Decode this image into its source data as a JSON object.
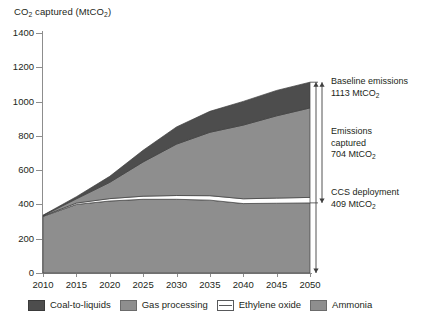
{
  "chart_data": {
    "type": "area",
    "title": "CO2 captured (MtCO2)",
    "title_parts": {
      "lead": "CO",
      "sub1": "2",
      "mid": " captured (MtCO",
      "sub2": "2",
      "tail": ")"
    },
    "xlabel": "",
    "ylabel": "CO2 captured (MtCO2)",
    "stacked": true,
    "grid": false,
    "legend_position": "bottom",
    "xlim": [
      2010,
      2050
    ],
    "ylim": [
      0,
      1400
    ],
    "x": [
      2010,
      2015,
      2020,
      2025,
      2030,
      2035,
      2040,
      2045,
      2050
    ],
    "xticks": [
      "2010",
      "2015",
      "2020",
      "2025",
      "2030",
      "2035",
      "2040",
      "2045",
      "2050"
    ],
    "yticks": [
      "0",
      "200",
      "400",
      "600",
      "800",
      "1000",
      "1200",
      "1400"
    ],
    "series": [
      {
        "name": "Ammonia",
        "color": "#8e8e8e",
        "values": [
          330,
          400,
          420,
          430,
          430,
          425,
          405,
          407,
          409
        ]
      },
      {
        "name": "Ethylene oxide",
        "color": "#ffffff",
        "values": [
          2,
          8,
          14,
          18,
          22,
          26,
          28,
          30,
          32
        ]
      },
      {
        "name": "Gas processing",
        "color": "#8e8e8e",
        "values": [
          3,
          25,
          95,
          200,
          300,
          370,
          430,
          480,
          522
        ]
      },
      {
        "name": "Coal-to-liquids",
        "color": "#4d4d4d",
        "values": [
          2,
          12,
          35,
          68,
          100,
          122,
          138,
          148,
          150
        ]
      }
    ],
    "totals": [
      337,
      445,
      564,
      716,
      852,
      943,
      1001,
      1065,
      1113
    ],
    "annotations": [
      {
        "id": "baseline",
        "line1": "Baseline emissions",
        "line2": "1113 MtCO",
        "sub": "2",
        "value": 1113
      },
      {
        "id": "captured",
        "line1": "Emissions",
        "line2": "captured",
        "line3": "704 MtCO",
        "sub": "2",
        "value": 704
      },
      {
        "id": "ccs",
        "line1": "CCS deployment",
        "line2": "409 MtCO",
        "sub": "2",
        "value": 409
      }
    ]
  },
  "legend": {
    "items": [
      {
        "label": "Coal-to-liquids",
        "swatch": "coal"
      },
      {
        "label": "Gas processing",
        "swatch": "gas"
      },
      {
        "label": "Ethylene oxide",
        "swatch": "eo"
      },
      {
        "label": "Ammonia",
        "swatch": "ammonia"
      }
    ]
  },
  "colors": {
    "coal_to_liquids": "#4d4d4d",
    "gas_processing": "#8e8e8e",
    "ethylene_oxide": "#ffffff",
    "ammonia": "#8e8e8e",
    "axis": "#8d8d8d",
    "text": "#231f20"
  }
}
